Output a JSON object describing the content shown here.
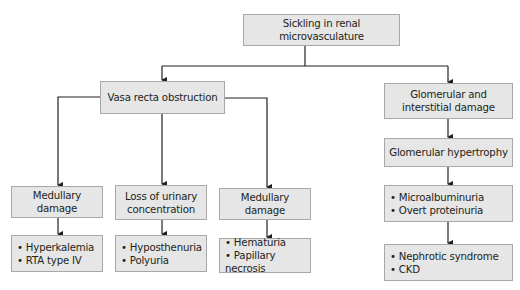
{
  "diagram": {
    "root": {
      "label": "Sickling in renal microvasculature"
    },
    "left_branch": {
      "label": "Vasa recta obstruction",
      "children": [
        {
          "label": "Medullary damage",
          "outcomes": [
            "Hyperkalemia",
            "RTA type IV"
          ]
        },
        {
          "label": "Loss of urinary concentration",
          "outcomes": [
            "Hyposthenuria",
            "Polyuria"
          ]
        },
        {
          "label": "Medullary damage",
          "outcomes": [
            "Hematuria",
            "Papillary necrosis"
          ]
        }
      ]
    },
    "right_branch": {
      "label": "Glomerular and interstitial damage",
      "step2": {
        "label": "Glomerular hypertrophy"
      },
      "step3": {
        "outcomes": [
          "Microalbuminuria",
          "Overt proteinuria"
        ]
      },
      "step4": {
        "outcomes": [
          "Nephrotic syndrome",
          "CKD"
        ]
      }
    }
  },
  "colors": {
    "box_fill": "#e6e6e6",
    "box_border": "#a8a8a8",
    "line": "#231f20"
  }
}
